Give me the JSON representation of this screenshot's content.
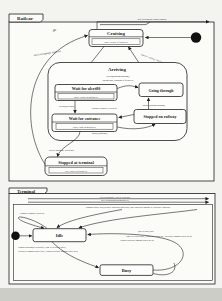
{
  "colors": {
    "ink": "#1f1f1f",
    "paper": "#f3f3f0",
    "page_edge": "#cdcdc8"
  },
  "railcar": {
    "tab": "Railcar",
    "states": {
      "cruising_name": "Cruising",
      "cruising_action": "entry/ 'cruise at fullspeed'",
      "arriving_name": "Arriving",
      "wait_alert80_name": "Wait for alert80",
      "wait_alert80_action": "entry/ 'cruise at halfspeed'",
      "going_through_name": "Going through",
      "wait_entrance_name": "Wait for entrance",
      "wait_entrance_action": "entry/ 'slow to halfspeed'",
      "stopped_railway_name": "Stopped on railway",
      "stopped_terminal_name": "Stopped at terminal",
      "stopped_terminal_action": "exit/ 'travel at fullspeed'"
    },
    "transitions": {
      "top_edge": "new destination/ and/or control",
      "depart": "go",
      "alert100": "alert100[stopping]/ clutch out",
      "started_cruising": "started cruising/ clutch out",
      "alert80_pass1": "alert80[passing through]/",
      "alert80_pass2": "'do not stop, crossing at fullspeed'",
      "alert80_keeping": "alert80[keeping]",
      "entrance_granted": "entrance granted/ clutch in",
      "go_on_stopping": "go on [stopping]",
      "go_on_passing": "go on [passing through]",
      "arrival_stopping": "arrival stopping/ clutch out"
    }
  },
  "terminal": {
    "tab": "Terminal",
    "states": {
      "idle_name": "Idle",
      "busy_name": "Busy"
    },
    "transitions": {
      "line1": "alert100[nonstop]/ alert at clockwise",
      "line2": "new destination[parking spotted]",
      "coming_request": "coming request/ alert[declined front00ps conflict02] 'other candidate passage w/ clockwise front00ps'",
      "terminal_coming": "terminal coming/ clutch out",
      "busy_idle1": "(not set 2000) null/",
      "busy_idle2": "'time to be halted null', 'clockwise vehicle go', 'clockwise lagging vehicle go on'",
      "busy_idle3": "'counterclockwise lagging vehicle go on'",
      "idle_busy1": "terminal stopping[at clockwise]/ 'time to be arrived 2000',",
      "idle_busy2": "'clockwise lagging vehicle stop', 'counterclockwise lagging vehicle stop'"
    }
  }
}
